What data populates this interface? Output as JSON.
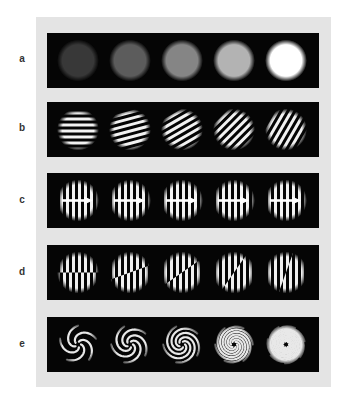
{
  "figure": {
    "colors": {
      "backdrop": "#e4e4e4",
      "panel": "#050505",
      "stimulus": "#ffffff",
      "label": "#333333"
    },
    "panel": {
      "x": 47,
      "width": 272,
      "height": 55,
      "circle_centers_x": [
        31,
        83,
        135,
        187,
        239
      ],
      "circle_radius": 19
    },
    "rows": [
      {
        "label": "a",
        "top": 33,
        "type": "luminance-disks",
        "intensities": [
          0.22,
          0.36,
          0.52,
          0.7,
          1.0
        ]
      },
      {
        "label": "b",
        "top": 102,
        "type": "oriented-gratings",
        "orientations_deg": [
          0,
          15,
          30,
          45,
          60
        ],
        "period_px": 6
      },
      {
        "label": "c",
        "top": 173,
        "type": "gratings-with-motion-arrow",
        "orientations_deg": [
          90,
          90,
          90,
          90,
          90
        ],
        "period_px": 6,
        "arrow_direction": "right"
      },
      {
        "label": "d",
        "top": 245,
        "type": "split-gratings",
        "split_angles_deg": [
          0,
          20,
          35,
          55,
          70
        ],
        "period_px": 6
      },
      {
        "label": "e",
        "top": 317,
        "type": "spiral-patterns",
        "arms": [
          5,
          5,
          5,
          6,
          7
        ],
        "turns": [
          0.35,
          0.5,
          0.7,
          1.0,
          1.4
        ]
      }
    ]
  }
}
